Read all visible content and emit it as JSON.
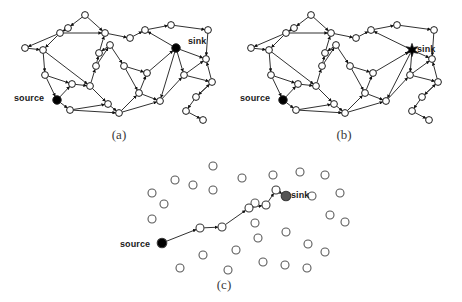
{
  "figure": {
    "type": "network-diagram",
    "background_color": "#ffffff",
    "stroke_color": "#1a1a1a",
    "node_fill_open": "#ffffff",
    "node_fill_terminal": "#000000",
    "sink_fill_c": "#555555",
    "panels": [
      {
        "id": "a",
        "caption": "(a)",
        "description": "dense directed network, source at lower-left, sink at upper-right"
      },
      {
        "id": "b",
        "caption": "(b)",
        "description": "dense directed network, same topology, sink drawn as star"
      },
      {
        "id": "c",
        "caption": "(c)",
        "description": "sparse node scatter with single routing path from source to sink"
      }
    ]
  },
  "labels": {
    "a_source": "source",
    "a_sink": "sink",
    "b_source": "source",
    "b_sink": "sink",
    "c_source": "source",
    "c_sink": "sink"
  },
  "captions": {
    "a": "(a)",
    "b": "(b)",
    "c": "(c)"
  },
  "chart_data": {
    "type": "scatter",
    "title": "",
    "xlabel": "",
    "ylabel": "",
    "panel_a": {
      "nodes": [
        {
          "id": 0,
          "x": 85,
          "y": 15,
          "kind": "open"
        },
        {
          "id": 1,
          "x": 68,
          "y": 28,
          "kind": "open"
        },
        {
          "id": 2,
          "x": 60,
          "y": 33,
          "kind": "open"
        },
        {
          "id": 3,
          "x": 43,
          "y": 50,
          "kind": "open"
        },
        {
          "id": 4,
          "x": 25,
          "y": 48,
          "kind": "open"
        },
        {
          "id": 5,
          "x": 45,
          "y": 75,
          "kind": "open"
        },
        {
          "id": 6,
          "x": 57,
          "y": 100,
          "kind": "source"
        },
        {
          "id": 7,
          "x": 70,
          "y": 110,
          "kind": "open"
        },
        {
          "id": 8,
          "x": 72,
          "y": 84,
          "kind": "open"
        },
        {
          "id": 9,
          "x": 90,
          "y": 86,
          "kind": "open"
        },
        {
          "id": 10,
          "x": 96,
          "y": 66,
          "kind": "open"
        },
        {
          "id": 11,
          "x": 110,
          "y": 45,
          "kind": "open"
        },
        {
          "id": 12,
          "x": 105,
          "y": 33,
          "kind": "open"
        },
        {
          "id": 13,
          "x": 99,
          "y": 53,
          "kind": "open"
        },
        {
          "id": 14,
          "x": 124,
          "y": 66,
          "kind": "open"
        },
        {
          "id": 15,
          "x": 108,
          "y": 104,
          "kind": "open"
        },
        {
          "id": 16,
          "x": 119,
          "y": 113,
          "kind": "open"
        },
        {
          "id": 17,
          "x": 139,
          "y": 93,
          "kind": "open"
        },
        {
          "id": 18,
          "x": 147,
          "y": 73,
          "kind": "open"
        },
        {
          "id": 19,
          "x": 145,
          "y": 30,
          "kind": "open"
        },
        {
          "id": 20,
          "x": 171,
          "y": 25,
          "kind": "open"
        },
        {
          "id": 21,
          "x": 176,
          "y": 48,
          "kind": "sink"
        },
        {
          "id": 22,
          "x": 160,
          "y": 101,
          "kind": "open"
        },
        {
          "id": 23,
          "x": 184,
          "y": 75,
          "kind": "open"
        },
        {
          "id": 24,
          "x": 206,
          "y": 59,
          "kind": "open"
        },
        {
          "id": 25,
          "x": 208,
          "y": 30,
          "kind": "open"
        },
        {
          "id": 26,
          "x": 212,
          "y": 82,
          "kind": "open"
        },
        {
          "id": 27,
          "x": 196,
          "y": 97,
          "kind": "open"
        },
        {
          "id": 28,
          "x": 186,
          "y": 111,
          "kind": "open"
        },
        {
          "id": 29,
          "x": 203,
          "y": 120,
          "kind": "open"
        },
        {
          "id": 30,
          "x": 130,
          "y": 38,
          "kind": "open"
        }
      ],
      "edges": [
        [
          0,
          1
        ],
        [
          0,
          12
        ],
        [
          1,
          2
        ],
        [
          2,
          3
        ],
        [
          2,
          4
        ],
        [
          3,
          5
        ],
        [
          5,
          6
        ],
        [
          6,
          7
        ],
        [
          6,
          8
        ],
        [
          8,
          9
        ],
        [
          9,
          10
        ],
        [
          10,
          13
        ],
        [
          13,
          12
        ],
        [
          12,
          30
        ],
        [
          30,
          19
        ],
        [
          19,
          20
        ],
        [
          20,
          25
        ],
        [
          25,
          24
        ],
        [
          21,
          19
        ],
        [
          21,
          24
        ],
        [
          21,
          23
        ],
        [
          21,
          22
        ],
        [
          11,
          13
        ],
        [
          11,
          14
        ],
        [
          14,
          17
        ],
        [
          17,
          22
        ],
        [
          22,
          23
        ],
        [
          23,
          24
        ],
        [
          23,
          26
        ],
        [
          26,
          24
        ],
        [
          26,
          27
        ],
        [
          27,
          28
        ],
        [
          28,
          29
        ],
        [
          7,
          15
        ],
        [
          15,
          16
        ],
        [
          16,
          17
        ],
        [
          9,
          15
        ],
        [
          10,
          11
        ],
        [
          4,
          3
        ],
        [
          5,
          8
        ],
        [
          18,
          21
        ],
        [
          14,
          18
        ],
        [
          17,
          18
        ],
        [
          7,
          16
        ],
        [
          2,
          12
        ],
        [
          3,
          9
        ],
        [
          27,
          26
        ],
        [
          16,
          22
        ]
      ]
    },
    "panel_b": {
      "nodes": [
        {
          "id": 0,
          "x": 311,
          "y": 15,
          "kind": "open"
        },
        {
          "id": 1,
          "x": 294,
          "y": 28,
          "kind": "open"
        },
        {
          "id": 2,
          "x": 286,
          "y": 33,
          "kind": "open"
        },
        {
          "id": 3,
          "x": 269,
          "y": 50,
          "kind": "open"
        },
        {
          "id": 4,
          "x": 251,
          "y": 48,
          "kind": "open"
        },
        {
          "id": 5,
          "x": 271,
          "y": 75,
          "kind": "open"
        },
        {
          "id": 6,
          "x": 283,
          "y": 100,
          "kind": "source"
        },
        {
          "id": 7,
          "x": 296,
          "y": 110,
          "kind": "open"
        },
        {
          "id": 8,
          "x": 298,
          "y": 84,
          "kind": "open"
        },
        {
          "id": 9,
          "x": 316,
          "y": 86,
          "kind": "open"
        },
        {
          "id": 10,
          "x": 322,
          "y": 66,
          "kind": "open"
        },
        {
          "id": 11,
          "x": 336,
          "y": 45,
          "kind": "open"
        },
        {
          "id": 12,
          "x": 331,
          "y": 33,
          "kind": "open"
        },
        {
          "id": 13,
          "x": 325,
          "y": 53,
          "kind": "open"
        },
        {
          "id": 14,
          "x": 350,
          "y": 66,
          "kind": "open"
        },
        {
          "id": 15,
          "x": 334,
          "y": 104,
          "kind": "open"
        },
        {
          "id": 16,
          "x": 345,
          "y": 113,
          "kind": "open"
        },
        {
          "id": 17,
          "x": 365,
          "y": 93,
          "kind": "open"
        },
        {
          "id": 18,
          "x": 373,
          "y": 73,
          "kind": "open"
        },
        {
          "id": 19,
          "x": 371,
          "y": 30,
          "kind": "open"
        },
        {
          "id": 20,
          "x": 397,
          "y": 25,
          "kind": "open"
        },
        {
          "id": 21,
          "x": 412,
          "y": 50,
          "kind": "sink-star"
        },
        {
          "id": 22,
          "x": 386,
          "y": 101,
          "kind": "open"
        },
        {
          "id": 23,
          "x": 410,
          "y": 75,
          "kind": "open"
        },
        {
          "id": 24,
          "x": 432,
          "y": 59,
          "kind": "open"
        },
        {
          "id": 25,
          "x": 434,
          "y": 30,
          "kind": "open"
        },
        {
          "id": 26,
          "x": 438,
          "y": 82,
          "kind": "open"
        },
        {
          "id": 27,
          "x": 422,
          "y": 97,
          "kind": "open"
        },
        {
          "id": 28,
          "x": 412,
          "y": 111,
          "kind": "open"
        },
        {
          "id": 29,
          "x": 429,
          "y": 120,
          "kind": "open"
        },
        {
          "id": 30,
          "x": 356,
          "y": 38,
          "kind": "open"
        }
      ],
      "edges": [
        [
          0,
          1
        ],
        [
          0,
          12
        ],
        [
          1,
          2
        ],
        [
          2,
          3
        ],
        [
          2,
          4
        ],
        [
          3,
          5
        ],
        [
          5,
          6
        ],
        [
          6,
          7
        ],
        [
          6,
          8
        ],
        [
          8,
          9
        ],
        [
          9,
          10
        ],
        [
          10,
          13
        ],
        [
          13,
          12
        ],
        [
          12,
          30
        ],
        [
          30,
          19
        ],
        [
          19,
          20
        ],
        [
          20,
          25
        ],
        [
          25,
          24
        ],
        [
          21,
          19
        ],
        [
          21,
          24
        ],
        [
          21,
          23
        ],
        [
          21,
          22
        ],
        [
          11,
          13
        ],
        [
          11,
          14
        ],
        [
          14,
          17
        ],
        [
          17,
          22
        ],
        [
          22,
          23
        ],
        [
          23,
          24
        ],
        [
          23,
          26
        ],
        [
          26,
          24
        ],
        [
          26,
          27
        ],
        [
          27,
          28
        ],
        [
          28,
          29
        ],
        [
          7,
          15
        ],
        [
          15,
          16
        ],
        [
          16,
          17
        ],
        [
          9,
          15
        ],
        [
          10,
          11
        ],
        [
          4,
          3
        ],
        [
          5,
          8
        ],
        [
          18,
          21
        ],
        [
          14,
          18
        ],
        [
          17,
          18
        ],
        [
          7,
          16
        ],
        [
          2,
          12
        ],
        [
          3,
          9
        ],
        [
          27,
          26
        ],
        [
          16,
          22
        ]
      ]
    },
    "panel_c": {
      "path_nodes": [
        {
          "id": 0,
          "x": 162,
          "y": 243,
          "kind": "source"
        },
        {
          "id": 1,
          "x": 200,
          "y": 228,
          "kind": "open"
        },
        {
          "id": 2,
          "x": 222,
          "y": 227,
          "kind": "open"
        },
        {
          "id": 3,
          "x": 249,
          "y": 208,
          "kind": "open"
        },
        {
          "id": 4,
          "x": 266,
          "y": 205,
          "kind": "open"
        },
        {
          "id": 5,
          "x": 276,
          "y": 190,
          "kind": "open"
        },
        {
          "id": 6,
          "x": 286,
          "y": 196,
          "kind": "sink"
        }
      ],
      "path_edges": [
        [
          0,
          1
        ],
        [
          1,
          2
        ],
        [
          2,
          3
        ],
        [
          3,
          4
        ],
        [
          4,
          5
        ],
        [
          5,
          6
        ]
      ],
      "scatter_nodes": [
        {
          "x": 213,
          "y": 166
        },
        {
          "x": 175,
          "y": 180
        },
        {
          "x": 193,
          "y": 185
        },
        {
          "x": 242,
          "y": 178
        },
        {
          "x": 213,
          "y": 190
        },
        {
          "x": 152,
          "y": 193
        },
        {
          "x": 273,
          "y": 175
        },
        {
          "x": 300,
          "y": 172
        },
        {
          "x": 325,
          "y": 175
        },
        {
          "x": 255,
          "y": 203
        },
        {
          "x": 312,
          "y": 196
        },
        {
          "x": 152,
          "y": 219
        },
        {
          "x": 330,
          "y": 215
        },
        {
          "x": 345,
          "y": 222
        },
        {
          "x": 286,
          "y": 232
        },
        {
          "x": 258,
          "y": 238
        },
        {
          "x": 308,
          "y": 244
        },
        {
          "x": 325,
          "y": 252
        },
        {
          "x": 236,
          "y": 250
        },
        {
          "x": 203,
          "y": 255
        },
        {
          "x": 263,
          "y": 262
        },
        {
          "x": 285,
          "y": 265
        },
        {
          "x": 228,
          "y": 270
        },
        {
          "x": 180,
          "y": 268
        },
        {
          "x": 307,
          "y": 268
        },
        {
          "x": 255,
          "y": 223
        },
        {
          "x": 164,
          "y": 204
        },
        {
          "x": 340,
          "y": 193
        }
      ]
    }
  }
}
